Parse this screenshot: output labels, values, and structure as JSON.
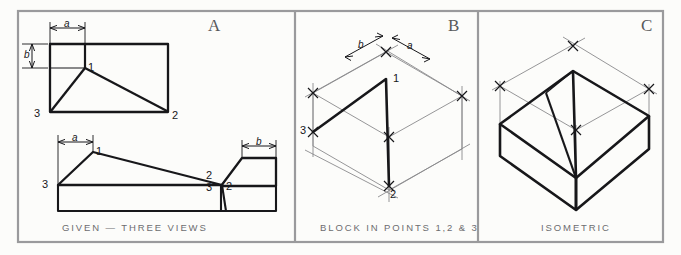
{
  "figure": {
    "background_color": "#fcfcfa",
    "border_color": "#9a9a9c",
    "line_color": "#17171a",
    "construction_color": "#8a8a8c",
    "caption_color": "#6d6d70"
  },
  "panels": [
    {
      "letter": "A",
      "caption": "GIVEN — THREE VIEWS",
      "point_labels": [
        "1",
        "2",
        "3",
        "1",
        "2",
        "3",
        "2",
        "3"
      ],
      "dimension_labels": [
        "a",
        "b",
        "a",
        "b"
      ]
    },
    {
      "letter": "B",
      "caption": "BLOCK IN POINTS 1,2 & 3",
      "point_labels": [
        "1",
        "2",
        "3"
      ],
      "dimension_labels": [
        "b",
        "a"
      ]
    },
    {
      "letter": "C",
      "caption": "ISOMETRIC",
      "point_labels": [],
      "dimension_labels": []
    }
  ],
  "panel_a": {
    "letter": "A",
    "caption": "GIVEN — THREE VIEWS",
    "views": [
      {
        "name": "top-view",
        "labels": [
          "1",
          "2",
          "3"
        ],
        "dims": [
          "a",
          "b"
        ]
      },
      {
        "name": "front-view",
        "labels": [
          "1",
          "2",
          "3"
        ],
        "dims": [
          "a"
        ]
      },
      {
        "name": "side-view",
        "labels": [
          "2",
          "3"
        ],
        "dims": [
          "b"
        ]
      }
    ],
    "labels": {
      "top_1": "1",
      "top_2": "2",
      "top_3": "3",
      "top_dim_a": "a",
      "top_dim_b": "b",
      "front_1": "1",
      "front_2": "2",
      "front_3": "3",
      "front_dim_a": "a",
      "side_2": "2",
      "side_3": "3",
      "side_dim_b": "b"
    }
  },
  "panel_b": {
    "letter": "B",
    "caption": "BLOCK IN POINTS 1,2 & 3",
    "labels": {
      "p1": "1",
      "p2": "2",
      "p3": "3",
      "dim_a": "a",
      "dim_b": "b"
    }
  },
  "panel_c": {
    "letter": "C",
    "caption": "ISOMETRIC"
  }
}
